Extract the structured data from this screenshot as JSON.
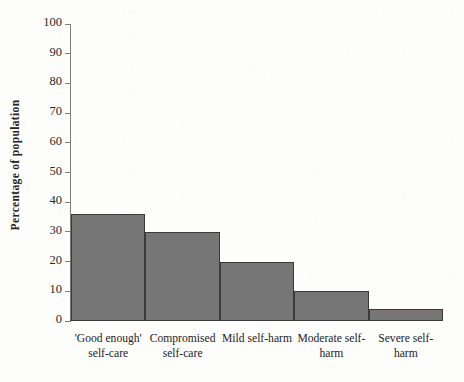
{
  "chart_data": {
    "type": "bar",
    "title": "",
    "xlabel": "",
    "ylabel": "Percentage of population",
    "categories": [
      "'Good enough' self-care",
      "Compromised self-care",
      "Mild self-harm",
      "Moderate self-harm",
      "Severe self-harm"
    ],
    "category_lines": [
      [
        "'Good enough'",
        "self-care"
      ],
      [
        "Compromised",
        "self-care"
      ],
      [
        "Mild self-harm",
        ""
      ],
      [
        "Moderate self-",
        "harm"
      ],
      [
        "Severe self-harm",
        ""
      ]
    ],
    "values": [
      36,
      30,
      20,
      10,
      4
    ],
    "ylim": [
      0,
      100
    ],
    "ytick_labels": [
      "0",
      "10",
      "20",
      "30",
      "40",
      "50",
      "60",
      "70",
      "80",
      "90",
      "100"
    ],
    "ytick_values": [
      0,
      10,
      20,
      30,
      40,
      50,
      60,
      70,
      80,
      90,
      100
    ],
    "grid": false,
    "legend": null,
    "bar_color": "#767676",
    "bar_edge_color": "#3a3a3a",
    "axis_color": "#7d7d7d",
    "text_color": "#242424",
    "background_color": "#fdfdfc",
    "contiguous_bars": true
  }
}
